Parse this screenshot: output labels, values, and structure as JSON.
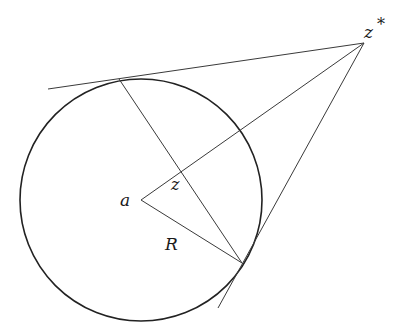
{
  "diagram": {
    "labels": {
      "center": "a",
      "inverse_point": "z",
      "external_point_base": "z",
      "external_point_star": "*",
      "radius": "R"
    },
    "colors": {
      "stroke": "#3a3a3a",
      "circle": "#222222",
      "text": "#1a1a1a",
      "background": "#ffffff"
    }
  }
}
